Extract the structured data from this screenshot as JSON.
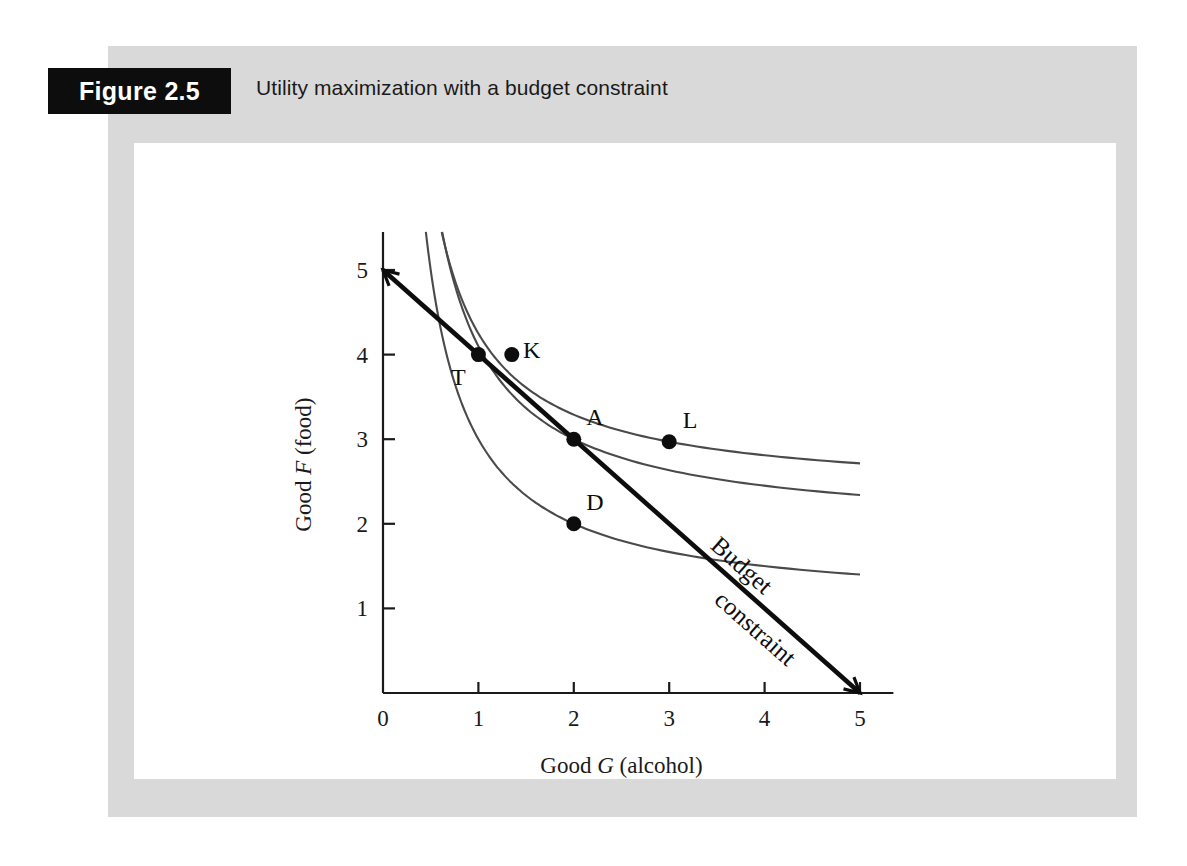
{
  "figure": {
    "number_label": "Figure 2.5",
    "caption": "Utility maximization with a budget constraint"
  },
  "colors": {
    "panel_gray": "#d9d9d9",
    "plate_white": "#ffffff",
    "box_black": "#0d0d0d",
    "curve_gray": "#4a4a4a",
    "budget_black": "#0d0d0d"
  },
  "chart_data": {
    "type": "line",
    "title": "Utility maximization with a budget constraint",
    "xlabel": "Good G (alcohol)",
    "xlabel_parts": {
      "lead": "Good ",
      "italic": "G",
      "tail": " (alcohol)"
    },
    "ylabel": "Good F (food)",
    "ylabel_parts": {
      "lead": "Good ",
      "italic": "F",
      "tail": " (food)"
    },
    "xlim": [
      0,
      5.35
    ],
    "ylim": [
      0,
      5.45
    ],
    "xticks": [
      0,
      1,
      2,
      3,
      4,
      5
    ],
    "xticklabels": [
      "0",
      "1",
      "2",
      "3",
      "4",
      "5"
    ],
    "yticks": [
      1,
      2,
      3,
      4,
      5
    ],
    "yticklabels": [
      "1",
      "2",
      "3",
      "4",
      "5"
    ],
    "grid": false,
    "legend": "none",
    "series": [
      {
        "name": "Budget constraint",
        "kind": "line",
        "label": "Budget constraint",
        "label_line1": "Budget",
        "label_line2": "constraint",
        "x": [
          0,
          5
        ],
        "y": [
          5,
          0
        ],
        "intercepts": {
          "x_intercept": 5,
          "y_intercept": 5
        },
        "slope": -1
      },
      {
        "name": "Indifference curve 1 (lowest)",
        "kind": "curve",
        "utility_constant": 4.0,
        "asymptote_y": 1.0,
        "points": [
          {
            "x": 0.87,
            "y": 5.4
          },
          {
            "x": 1.0,
            "y": 4.0
          },
          {
            "x": 2.0,
            "y": 2.0
          },
          {
            "x": 3.0,
            "y": 1.4
          },
          {
            "x": 5.0,
            "y": 1.0
          }
        ]
      },
      {
        "name": "Indifference curve 2 (middle, tangent)",
        "kind": "curve",
        "utility_constant": 6.0,
        "asymptote_y": 1.9,
        "points": [
          {
            "x": 1.1,
            "y": 5.4
          },
          {
            "x": 1.35,
            "y": 4.0
          },
          {
            "x": 2.0,
            "y": 3.0
          },
          {
            "x": 3.0,
            "y": 2.38
          },
          {
            "x": 5.0,
            "y": 1.9
          }
        ]
      },
      {
        "name": "Indifference curve 3 (highest)",
        "kind": "curve",
        "utility_constant": 9.0,
        "asymptote_y": 2.33,
        "points": [
          {
            "x": 1.7,
            "y": 5.4
          },
          {
            "x": 2.2,
            "y": 4.0
          },
          {
            "x": 3.0,
            "y": 2.97
          },
          {
            "x": 5.0,
            "y": 2.33
          }
        ]
      }
    ],
    "annotations": [
      {
        "id": "T",
        "label": "T",
        "x": 1.0,
        "y": 4.0,
        "on": "Indifference curve 1 (lowest)",
        "label_pos": "below-left"
      },
      {
        "id": "K",
        "label": "K",
        "x": 1.35,
        "y": 4.0,
        "on": "Indifference curve 2 (middle, tangent)",
        "label_pos": "right"
      },
      {
        "id": "A",
        "label": "A",
        "x": 2.0,
        "y": 3.0,
        "on": "Indifference curve 2 (middle, tangent)",
        "label_pos": "upper-right"
      },
      {
        "id": "L",
        "label": "L",
        "x": 3.0,
        "y": 2.97,
        "on": "Indifference curve 3 (highest)",
        "label_pos": "upper-right"
      },
      {
        "id": "D",
        "label": "D",
        "x": 2.0,
        "y": 2.0,
        "on": "Indifference curve 1 (lowest)",
        "label_pos": "upper-right"
      }
    ]
  }
}
